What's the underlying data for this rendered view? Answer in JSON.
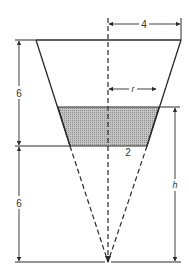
{
  "diagram": {
    "type": "conical-frustum-tank",
    "labels": {
      "top_radius": "4",
      "water_radius": "r",
      "bottom_radius": "2",
      "upper_height": "6",
      "lower_height": "6",
      "water_height": "h"
    },
    "colors": {
      "line": "#2a2a2a",
      "water_fill": "#b8b8b8"
    }
  }
}
